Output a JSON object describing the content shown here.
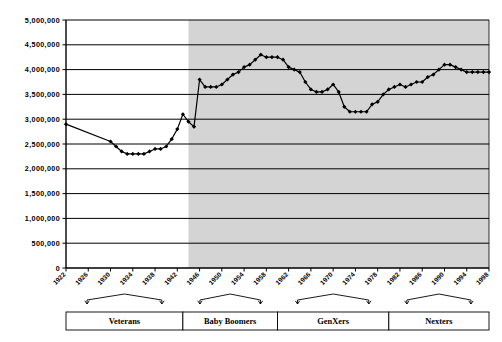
{
  "chart_data": {
    "type": "line",
    "title": "",
    "subtitle": "",
    "xlabel": "",
    "ylabel": "",
    "grid": true,
    "legend": false,
    "xlim": [
      1922,
      1998
    ],
    "ylim": [
      0,
      5000000
    ],
    "y_ticks": [
      0,
      500000,
      1000000,
      1500000,
      2000000,
      2500000,
      3000000,
      3500000,
      4000000,
      4500000,
      5000000
    ],
    "y_tick_labels": [
      "0",
      "500,000",
      "1,000,000",
      "1,500,000",
      "2,000,000",
      "2,500,000",
      "3,000,000",
      "3,500,000",
      "4,000,000",
      "4,500,000",
      "5,000,000"
    ],
    "x_ticks": [
      1922,
      1926,
      1930,
      1934,
      1938,
      1942,
      1946,
      1950,
      1954,
      1958,
      1962,
      1966,
      1970,
      1974,
      1978,
      1982,
      1986,
      1990,
      1994,
      1998
    ],
    "x_tick_labels": [
      "1922",
      "1926",
      "1930",
      "1934",
      "1938",
      "1942",
      "1946",
      "1950",
      "1954",
      "1958",
      "1962",
      "1966",
      "1970",
      "1974",
      "1978",
      "1982",
      "1986",
      "1990",
      "1994",
      "1998"
    ],
    "shaded_region": {
      "from": 1944,
      "to": 1998,
      "color": "#d4d4d4"
    },
    "series": [
      {
        "name": "Births",
        "marker": "diamond",
        "color": "#000000",
        "x": [
          1922,
          1930,
          1931,
          1932,
          1933,
          1934,
          1935,
          1936,
          1937,
          1938,
          1939,
          1940,
          1941,
          1942,
          1943,
          1944,
          1945,
          1946,
          1947,
          1948,
          1949,
          1950,
          1951,
          1952,
          1953,
          1954,
          1955,
          1956,
          1957,
          1958,
          1959,
          1960,
          1961,
          1962,
          1963,
          1964,
          1965,
          1966,
          1967,
          1968,
          1969,
          1970,
          1971,
          1972,
          1973,
          1974,
          1975,
          1976,
          1977,
          1978,
          1979,
          1980,
          1981,
          1982,
          1983,
          1984,
          1985,
          1986,
          1987,
          1988,
          1989,
          1990,
          1991,
          1992,
          1993,
          1994,
          1995,
          1996,
          1997,
          1998
        ],
        "y": [
          2900000,
          2550000,
          2450000,
          2350000,
          2300000,
          2300000,
          2300000,
          2300000,
          2350000,
          2400000,
          2400000,
          2450000,
          2600000,
          2800000,
          3100000,
          2950000,
          2850000,
          3800000,
          3650000,
          3650000,
          3650000,
          3700000,
          3800000,
          3900000,
          3950000,
          4050000,
          4100000,
          4200000,
          4300000,
          4250000,
          4250000,
          4250000,
          4200000,
          4050000,
          4000000,
          3950000,
          3750000,
          3600000,
          3550000,
          3550000,
          3600000,
          3700000,
          3550000,
          3250000,
          3150000,
          3150000,
          3150000,
          3150000,
          3300000,
          3350000,
          3500000,
          3600000,
          3650000,
          3700000,
          3650000,
          3700000,
          3750000,
          3750000,
          3850000,
          3900000,
          4000000,
          4100000,
          4100000,
          4050000,
          4000000,
          3950000,
          3950000,
          3950000,
          3950000,
          3950000
        ]
      }
    ],
    "generations": [
      {
        "label": "Veterans",
        "start_year": 1922,
        "end_year": 1943
      },
      {
        "label": "Baby Boomers",
        "start_year": 1943,
        "end_year": 1960
      },
      {
        "label": "GenXers",
        "start_year": 1960,
        "end_year": 1980
      },
      {
        "label": "Nexters",
        "start_year": 1980,
        "end_year": 1998
      }
    ]
  }
}
